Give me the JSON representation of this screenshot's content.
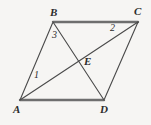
{
  "figure": {
    "background_color": "#f6f5f3",
    "stroke_color": "#4a4a4a",
    "heavy_stroke_color": "#6e6e6e",
    "label_color": "#2c2c2c",
    "vertices": [
      {
        "id": "A",
        "label": "A",
        "x": 20,
        "y": 100,
        "label_x": 13,
        "label_y": 104
      },
      {
        "id": "B",
        "label": "B",
        "x": 53,
        "y": 22,
        "label_x": 50,
        "label_y": 7
      },
      {
        "id": "C",
        "label": "C",
        "x": 138,
        "y": 22,
        "label_x": 134,
        "label_y": 6
      },
      {
        "id": "D",
        "label": "D",
        "x": 104,
        "y": 100,
        "label_x": 100,
        "label_y": 104
      },
      {
        "id": "E",
        "label": "E",
        "x": 78,
        "y": 61,
        "label_x": 84,
        "label_y": 56
      }
    ],
    "sides": [
      {
        "from": "A",
        "to": "B",
        "weight": "thin"
      },
      {
        "from": "B",
        "to": "C",
        "weight": "heavy"
      },
      {
        "from": "C",
        "to": "D",
        "weight": "thin"
      },
      {
        "from": "A",
        "to": "D",
        "weight": "heavy"
      }
    ],
    "diagonals": [
      {
        "from": "A",
        "to": "C",
        "through": "E",
        "weight": "thin"
      },
      {
        "from": "B",
        "to": "D",
        "through": "E",
        "weight": "thin"
      }
    ],
    "angle_labels": [
      {
        "id": "angle-1",
        "label": "1",
        "at_vertex": "A",
        "x": 34,
        "y": 70
      },
      {
        "id": "angle-2",
        "label": "2",
        "at_vertex": "C",
        "x": 110,
        "y": 23
      },
      {
        "id": "angle-3",
        "label": "3",
        "at_vertex": "B",
        "x": 52,
        "y": 30
      }
    ]
  }
}
